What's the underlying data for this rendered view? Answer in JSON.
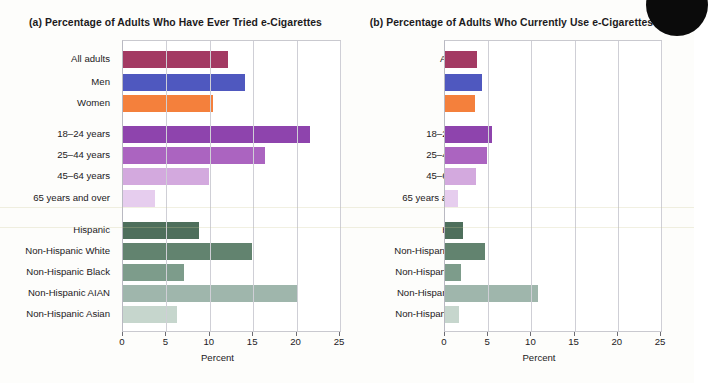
{
  "figure": {
    "background_color": "#fdfdfb",
    "categories": [
      "All adults",
      "Men",
      "Women",
      "18–24 years",
      "25–44 years",
      "45–64 years",
      "65 years and over",
      "Hispanic",
      "Non-Hispanic White",
      "Non-Hispanic Black",
      "Non-Hispanic AIAN",
      "Non-Hispanic Asian"
    ],
    "bar_colors": [
      "#a33a63",
      "#4f58bf",
      "#f4803c",
      "#8e44ad",
      "#ab64c0",
      "#d3a9de",
      "#e6cdee",
      "#4e6f5c",
      "#62836f",
      "#7d9c8b",
      "#9fb6ac",
      "#c6d6cd"
    ],
    "axis_title": "Percent",
    "tick_values": [
      0,
      5,
      10,
      15,
      20,
      25
    ]
  },
  "chart_data": [
    {
      "type": "bar",
      "orientation": "horizontal",
      "panel": "a",
      "title": "(a) Percentage of Adults Who Have Ever Tried e-Cigarettes",
      "xlabel": "Percent",
      "ylabel": "",
      "xlim": [
        0,
        25
      ],
      "xticks": [
        0,
        5,
        10,
        15,
        20,
        25
      ],
      "grid": true,
      "legend": "none",
      "categories": [
        "All adults",
        "Men",
        "Women",
        "18–24 years",
        "25–44 years",
        "45–64 years",
        "65 years and over",
        "Hispanic",
        "Non-Hispanic White",
        "Non-Hispanic Black",
        "Non-Hispanic AIAN",
        "Non-Hispanic Asian"
      ],
      "values": [
        12.1,
        14.0,
        10.4,
        21.6,
        16.4,
        9.9,
        3.7,
        8.7,
        14.9,
        7.0,
        20.2,
        6.2
      ]
    },
    {
      "type": "bar",
      "orientation": "horizontal",
      "panel": "b",
      "title": "(b) Percentage of Adults Who Currently Use e-Cigarettes",
      "xlabel": "Percent",
      "ylabel": "",
      "xlim": [
        0,
        25
      ],
      "xticks": [
        0,
        5,
        10,
        15,
        20,
        25
      ],
      "grid": true,
      "legend": "none",
      "categories": [
        "All adults",
        "Men",
        "Women",
        "18–24 years",
        "25–44 years",
        "45–64 years",
        "65 years and over",
        "Hispanic",
        "Non-Hispanic White",
        "Non-Hispanic Black",
        "Non-Hispanic AIAN",
        "Non-Hispanic Asian"
      ],
      "values": [
        3.7,
        4.3,
        3.5,
        5.4,
        4.9,
        3.6,
        1.5,
        2.1,
        4.6,
        1.9,
        10.8,
        1.6
      ]
    }
  ],
  "panel_a": {
    "title": "(a) Percentage of Adults Who Have Ever Tried e-Cigarettes",
    "axis_title": "Percent"
  },
  "panel_b": {
    "title": "(b) Percentage of Adults Who Currently Use e-Cigarettes",
    "axis_title": "Percent"
  }
}
